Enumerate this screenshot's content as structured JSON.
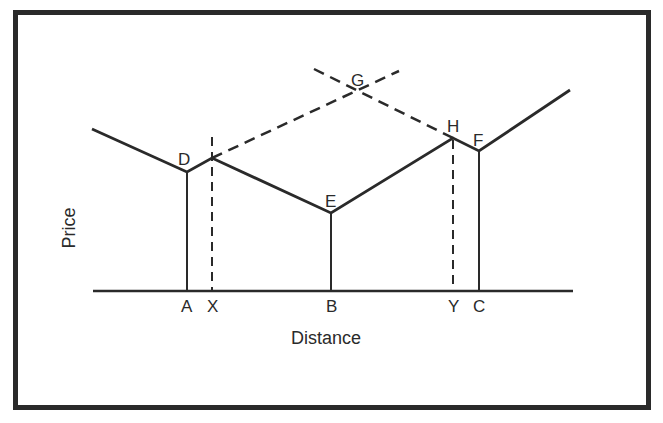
{
  "diagram": {
    "axes": {
      "x_label": "Distance",
      "y_label": "Price"
    },
    "points": {
      "D": "D",
      "E": "E",
      "F": "F",
      "G": "G",
      "H": "H"
    },
    "axis_points": {
      "A": "A",
      "X": "X",
      "B": "B",
      "Y": "Y",
      "C": "C"
    },
    "colors": {
      "ink": "#2a2a2a",
      "background": "#ffffff"
    }
  }
}
